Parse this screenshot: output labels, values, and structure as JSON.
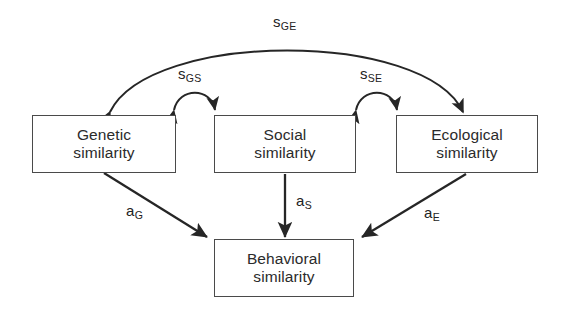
{
  "diagram": {
    "background_color": "#ffffff",
    "line_color": "#262626",
    "box_border_color": "#4a4a4a",
    "text_color": "#2b2b2b",
    "nodes": [
      {
        "id": "genetic",
        "line1": "Genetic",
        "line2": "similarity"
      },
      {
        "id": "social",
        "line1": "Social",
        "line2": "similarity"
      },
      {
        "id": "ecological",
        "line1": "Ecological",
        "line2": "similarity"
      },
      {
        "id": "behavioral",
        "line1": "Behavioral",
        "line2": "similarity"
      }
    ],
    "edges": [
      {
        "id": "s-ge",
        "base": "s",
        "sub": "GE",
        "kind": "double-arrow-arc",
        "from": "genetic",
        "to": "ecological"
      },
      {
        "id": "s-gs",
        "base": "s",
        "sub": "GS",
        "kind": "double-arrow-arc",
        "from": "genetic",
        "to": "social"
      },
      {
        "id": "s-se",
        "base": "s",
        "sub": "SE",
        "kind": "double-arrow-arc",
        "from": "social",
        "to": "ecological"
      },
      {
        "id": "a-g",
        "base": "a",
        "sub": "G",
        "kind": "single-arrow",
        "from": "genetic",
        "to": "behavioral"
      },
      {
        "id": "a-s",
        "base": "a",
        "sub": "S",
        "kind": "single-arrow",
        "from": "social",
        "to": "behavioral"
      },
      {
        "id": "a-e",
        "base": "a",
        "sub": "E",
        "kind": "single-arrow",
        "from": "ecological",
        "to": "behavioral"
      }
    ]
  }
}
